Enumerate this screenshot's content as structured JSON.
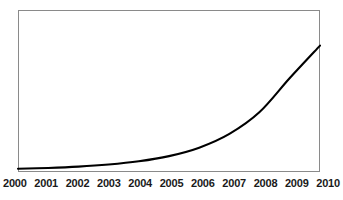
{
  "chart_data": {
    "type": "line",
    "title": "",
    "subtitle": "",
    "xlabel": "",
    "ylabel": "",
    "grid": false,
    "legend": false,
    "legend_position": "none",
    "line_color": "#000000",
    "frame_color": "#8a8a8a",
    "background_color": "#ffffff",
    "x": [
      2000,
      2001,
      2002,
      2003,
      2004,
      2005,
      2006,
      2007,
      2008,
      2009,
      2010
    ],
    "xlim": [
      2000,
      2010
    ],
    "ylim": [
      0,
      100
    ],
    "tick_labels": [
      "2000",
      "2001",
      "2002",
      "2003",
      "2004",
      "2005",
      "2006",
      "2007",
      "2008",
      "2009",
      "2010"
    ],
    "series": [
      {
        "name": "exponential growth",
        "values": [
          2,
          2.5,
          3.3,
          4.6,
          6.6,
          9.8,
          15,
          23.5,
          37,
          58,
          78
        ]
      }
    ]
  },
  "axis": {
    "x_ticks": [
      "2000",
      "2001",
      "2002",
      "2003",
      "2004",
      "2005",
      "2006",
      "2007",
      "2008",
      "2009",
      "2010"
    ]
  }
}
